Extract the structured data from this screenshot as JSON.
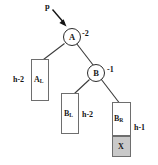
{
  "diagram": {
    "background_color": "#ffffff",
    "pointer": {
      "label": "p",
      "target": "A"
    },
    "nodes": [
      {
        "id": "A",
        "label": "A",
        "balance_factor": "-2"
      },
      {
        "id": "B",
        "label": "B",
        "balance_factor": "-1"
      }
    ],
    "subtrees": [
      {
        "id": "AL",
        "label": "A",
        "sub": "L",
        "height": "h-2",
        "shaded": false
      },
      {
        "id": "BL",
        "label": "B",
        "sub": "L",
        "height": "h-2",
        "shaded": false
      },
      {
        "id": "BR",
        "label": "B",
        "sub": "R",
        "height": "h-1",
        "shaded": false
      },
      {
        "id": "X",
        "label": "X",
        "sub": "",
        "height": "",
        "shaded": true
      }
    ],
    "colors": {
      "node_stroke": "#2b2b2b",
      "box_stroke": "#6e6e6e",
      "edge": "#3a3a3a",
      "shade_fill": "#c9c9c9",
      "text": "#141414"
    }
  }
}
